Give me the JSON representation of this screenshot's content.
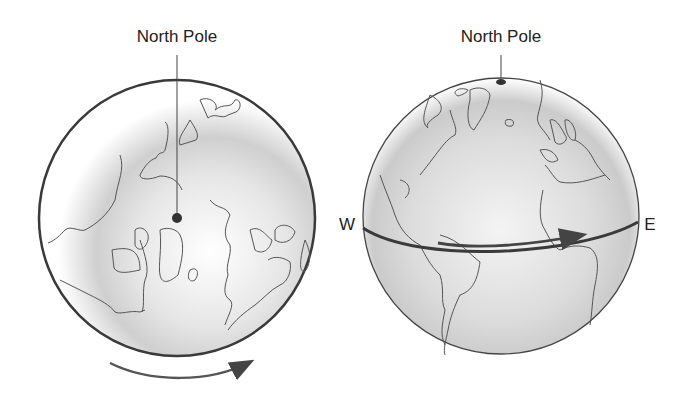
{
  "left_globe": {
    "label": "North Pole",
    "view": "polar view from above North Pole",
    "rotation_arrow": "counterclockwise-bottom-left-to-right"
  },
  "right_globe": {
    "label": "North Pole",
    "west_label": "W",
    "east_label": "E",
    "rotation_arrow": "west-to-east"
  },
  "colors": {
    "outline": "#3a3a3a",
    "shade": "#c8c8c8",
    "text": "#222222"
  }
}
